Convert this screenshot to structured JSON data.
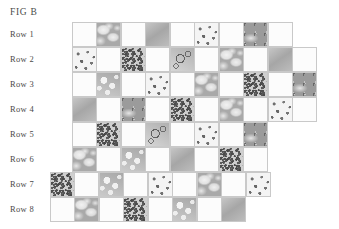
{
  "figure": {
    "title": "FIG B",
    "background_color": "#ffffff",
    "text_color": "#4a4a4a",
    "grid_line_color": "#c9c9c9",
    "blank_cell_color": "#fcfcfc"
  },
  "row_labels": [
    "Row 1",
    "Row 2",
    "Row 3",
    "Row 4",
    "Row 5",
    "Row 6",
    "Row 7",
    "Row 8"
  ],
  "chart_data": {
    "type": "heatmap",
    "title": "FIG B",
    "xlabel": "",
    "ylabel": "",
    "cell_size_px": 25,
    "row_count": 8,
    "legend": [],
    "texture_keys": [
      "blank",
      "speckle",
      "cloud",
      "sparse",
      "wash",
      "streak",
      "ring",
      "pale",
      "clump"
    ],
    "rows": [
      {
        "label": "Row 1",
        "offset_px": 72,
        "top_px": 22,
        "cells": [
          "blank",
          "cloud",
          "blank",
          "wash",
          "blank",
          "sparse",
          "blank",
          "streak",
          "blank"
        ]
      },
      {
        "label": "Row 2",
        "offset_px": 72,
        "top_px": 47,
        "cells": [
          "sparse",
          "blank",
          "speckle",
          "blank",
          "ring",
          "blank",
          "cloud",
          "blank",
          "wash",
          "blank"
        ]
      },
      {
        "label": "Row 3",
        "offset_px": 72,
        "top_px": 72,
        "cells": [
          "blank",
          "clump",
          "blank",
          "sparse",
          "blank",
          "cloud",
          "blank",
          "speckle",
          "blank",
          "streak"
        ]
      },
      {
        "label": "Row 4",
        "offset_px": 72,
        "top_px": 97,
        "cells": [
          "wash",
          "blank",
          "streak",
          "blank",
          "speckle",
          "blank",
          "cloud",
          "blank",
          "sparse",
          "blank"
        ]
      },
      {
        "label": "Row 5",
        "offset_px": 72,
        "top_px": 122,
        "cells": [
          "blank",
          "speckle",
          "blank",
          "ring",
          "blank",
          "sparse",
          "blank",
          "streak"
        ]
      },
      {
        "label": "Row 6",
        "offset_px": 72,
        "top_px": 147,
        "cells": [
          "cloud",
          "blank",
          "clump",
          "blank",
          "wash",
          "blank",
          "speckle",
          "blank"
        ]
      },
      {
        "label": "Row 7",
        "offset_px": 50,
        "top_px": 172,
        "cells": [
          "speckle",
          "blank",
          "clump",
          "blank",
          "sparse",
          "blank",
          "cloud",
          "blank",
          "sparse"
        ]
      },
      {
        "label": "Row 8",
        "offset_px": 50,
        "top_px": 197,
        "cells": [
          "blank",
          "cloud",
          "blank",
          "speckle",
          "blank",
          "clump",
          "blank",
          "wash"
        ]
      }
    ]
  }
}
